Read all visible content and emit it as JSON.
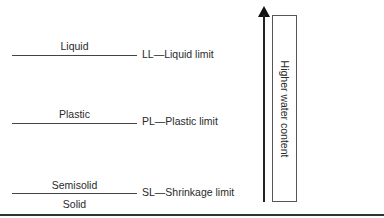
{
  "states": {
    "liquid": "Liquid",
    "plastic": "Plastic",
    "semisolid": "Semisolid",
    "solid": "Solid"
  },
  "limits": {
    "liquid_limit": "LL—Liquid limit",
    "plastic_limit": "PL—Plastic limit",
    "shrinkage_limit": "SL—Shrinkage limit"
  },
  "axis": {
    "label": "Higher water content",
    "direction_icon": "arrow-up-icon"
  }
}
